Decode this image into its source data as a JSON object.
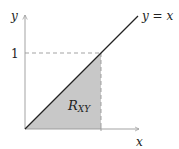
{
  "diagram": {
    "y_axis_label": "y",
    "x_axis_label": "x",
    "line_label_lhs": "y",
    "line_label_eq": " = ",
    "line_label_rhs": "x",
    "tick_y_label": "1",
    "region_label_main": "R",
    "region_label_sub": "XY",
    "colors": {
      "region_fill": "#c8c8c8",
      "line": "#222222",
      "axis": "#999999",
      "dashed": "#999999"
    }
  }
}
